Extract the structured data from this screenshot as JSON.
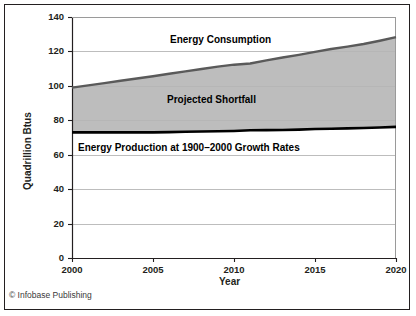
{
  "figure": {
    "credit": "© Infobase Publishing",
    "frame_color": "#231f20",
    "background": "#ffffff"
  },
  "chart_data": {
    "type": "area",
    "title": "",
    "subtitle": "",
    "xlabel": "Year",
    "ylabel": "Quadrillion Btus",
    "xlim": [
      2000,
      2020
    ],
    "ylim": [
      0,
      140
    ],
    "xticks": [
      2000,
      2005,
      2010,
      2015,
      2020
    ],
    "xtick_labels": [
      "2000",
      "2005",
      "2010",
      "2015",
      "2020"
    ],
    "yticks": [
      0,
      20,
      40,
      60,
      80,
      100,
      120,
      140
    ],
    "ytick_labels": [
      "0",
      "20",
      "40",
      "60",
      "80",
      "100",
      "120",
      "140"
    ],
    "grid": true,
    "grid_axis": "y",
    "grid_color": "#b5b5b5",
    "legend": "inline-annotations",
    "legend_position": "in-plot",
    "fill_color": "#bdbdbd",
    "x": [
      2000,
      2001,
      2002,
      2003,
      2004,
      2005,
      2006,
      2007,
      2008,
      2009,
      2010,
      2011,
      2012,
      2013,
      2014,
      2015,
      2016,
      2017,
      2018,
      2019,
      2020
    ],
    "series": [
      {
        "name": "Energy Consumption",
        "color": "#5a5a5a",
        "line_width": 2.4,
        "values": [
          99.0,
          100.3,
          101.6,
          103.0,
          104.3,
          105.6,
          107.0,
          108.4,
          109.8,
          111.2,
          112.3,
          113.0,
          114.8,
          116.5,
          118.0,
          119.7,
          121.4,
          122.8,
          124.3,
          126.2,
          128.3
        ]
      },
      {
        "name": "Energy Production at 1900–2000 Growth Rates",
        "color": "#000000",
        "line_width": 2.6,
        "values": [
          73.0,
          73.0,
          73.0,
          73.0,
          73.0,
          73.0,
          73.1,
          73.3,
          73.5,
          73.6,
          73.8,
          74.2,
          74.3,
          74.4,
          74.6,
          74.9,
          75.1,
          75.3,
          75.5,
          75.8,
          76.2
        ]
      }
    ],
    "annotations": [
      {
        "text": "Energy Consumption",
        "x": 2007.0,
        "y": 125.0,
        "name": "energy-consumption-label"
      },
      {
        "text": "Projected Shortfall",
        "x": 2006.6,
        "y": 96.0,
        "name": "projected-shortfall-label"
      },
      {
        "text": "Energy Production at 1900–2000 Growth Rates",
        "x": 2008.4,
        "y": 66.5,
        "name": "energy-production-label"
      }
    ],
    "shaded_region": {
      "name": "Projected Shortfall",
      "between": [
        "Energy Production at 1900–2000 Growth Rates",
        "Energy Consumption"
      ],
      "color": "#bdbdbd"
    }
  }
}
